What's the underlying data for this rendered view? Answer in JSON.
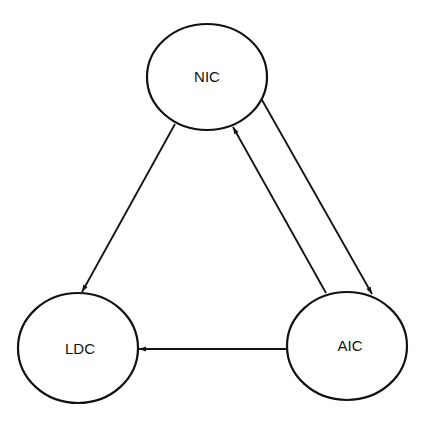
{
  "diagram": {
    "type": "directed-graph",
    "nodes": [
      {
        "id": "NIC",
        "label": "NIC",
        "cx": 207,
        "cy": 77,
        "rx": 60,
        "ry": 53
      },
      {
        "id": "LDC",
        "label": "LDC",
        "cx": 78,
        "cy": 348,
        "rx": 60,
        "ry": 55
      },
      {
        "id": "AIC",
        "label": "AIC",
        "cx": 347,
        "cy": 346,
        "rx": 60,
        "ry": 54
      }
    ],
    "edges": [
      {
        "from": "NIC",
        "to": "LDC"
      },
      {
        "from": "NIC",
        "to": "AIC"
      },
      {
        "from": "AIC",
        "to": "NIC"
      },
      {
        "from": "AIC",
        "to": "LDC"
      }
    ],
    "colors": {
      "stroke": "#111111",
      "background": "#ffffff"
    }
  }
}
